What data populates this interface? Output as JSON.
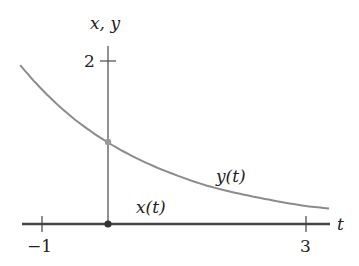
{
  "chart_data": {
    "type": "line",
    "title": "",
    "xlabel": "t",
    "ylabel": "x, y",
    "xlim": [
      -1.33,
      3.35
    ],
    "ylim": [
      0,
      2.2
    ],
    "x_ticks": [
      -1,
      3
    ],
    "x_tick_labels": [
      "−1",
      "3"
    ],
    "y_ticks": [
      2
    ],
    "y_tick_labels": [
      "2"
    ],
    "grid": false,
    "legend": "inline labels",
    "series": [
      {
        "name": "y(t)",
        "color": "#8c8c8c",
        "formula": "approximately e^(-t/2)",
        "x": [
          -1.33,
          -1,
          -0.5,
          0,
          0.5,
          1,
          1.5,
          2,
          2.5,
          3,
          3.35
        ],
        "values": [
          1.95,
          1.65,
          1.28,
          1.0,
          0.78,
          0.61,
          0.47,
          0.37,
          0.29,
          0.22,
          0.19
        ]
      },
      {
        "name": "x(t)",
        "color": "#444444",
        "x": [
          -1.33,
          3.35
        ],
        "values": [
          0,
          0
        ]
      }
    ],
    "points": [
      {
        "name": "y(0)",
        "t": 0,
        "value": 1.0,
        "color": "#9a9a9a"
      },
      {
        "name": "x(0)",
        "t": 0,
        "value": 0,
        "color": "#333333"
      }
    ],
    "annotations": [
      {
        "text": "y(t)",
        "t": 2.0,
        "value": 0.62
      },
      {
        "text": "x(t)",
        "t": 0.5,
        "value": 0.12
      }
    ]
  },
  "labels": {
    "y_axis": "x, y",
    "x_axis": "t",
    "tick_y2": "2",
    "tick_xm1": "−1",
    "tick_x3": "3",
    "series_y": "y(t)",
    "series_x": "x(t)"
  }
}
